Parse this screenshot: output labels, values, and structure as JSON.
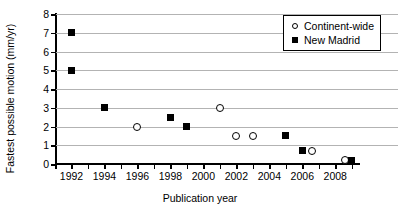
{
  "chart_data": {
    "type": "scatter",
    "title": "",
    "xlabel": "Publication year",
    "ylabel": "Fastest possible motion (mm/yr)",
    "xlim": [
      1991,
      2009.5
    ],
    "ylim": [
      0,
      8
    ],
    "grid": true,
    "legend_position": "top-right",
    "x_ticks": [
      1991,
      1992,
      1993,
      1994,
      1995,
      1996,
      1997,
      1998,
      1999,
      2000,
      2001,
      2002,
      2003,
      2004,
      2005,
      2006,
      2007,
      2008,
      2009
    ],
    "x_tick_labels": [
      "1992",
      "1994",
      "1996",
      "1998",
      "2000",
      "2002",
      "2004",
      "2006",
      "2008"
    ],
    "x_tick_label_values": [
      1992,
      1994,
      1996,
      1998,
      2000,
      2002,
      2004,
      2006,
      2008
    ],
    "y_ticks": [
      0,
      1,
      2,
      3,
      4,
      5,
      6,
      7,
      8
    ],
    "y_tick_labels": [
      "0",
      "1",
      "2",
      "3",
      "4",
      "5",
      "6",
      "7",
      "8"
    ],
    "series": [
      {
        "name": "Continent-wide",
        "marker": "open-circle",
        "color": "#000000",
        "points": [
          {
            "x": 1996,
            "y": 2.0
          },
          {
            "x": 2001,
            "y": 3.0
          },
          {
            "x": 2002,
            "y": 1.5
          },
          {
            "x": 2003,
            "y": 1.5
          },
          {
            "x": 2006.6,
            "y": 0.7
          },
          {
            "x": 2008.6,
            "y": 0.2
          }
        ]
      },
      {
        "name": "New Madrid",
        "marker": "filled-square",
        "color": "#000000",
        "points": [
          {
            "x": 1992,
            "y": 7.0
          },
          {
            "x": 1992,
            "y": 5.0
          },
          {
            "x": 1994,
            "y": 3.0
          },
          {
            "x": 1998,
            "y": 2.5
          },
          {
            "x": 1999,
            "y": 2.0
          },
          {
            "x": 2005,
            "y": 1.5
          },
          {
            "x": 2006,
            "y": 0.7
          },
          {
            "x": 2009,
            "y": 0.2
          }
        ]
      }
    ]
  },
  "legend": {
    "items": [
      {
        "label": "Continent-wide",
        "marker": "open-circle"
      },
      {
        "label": "New Madrid",
        "marker": "filled-square"
      }
    ]
  }
}
